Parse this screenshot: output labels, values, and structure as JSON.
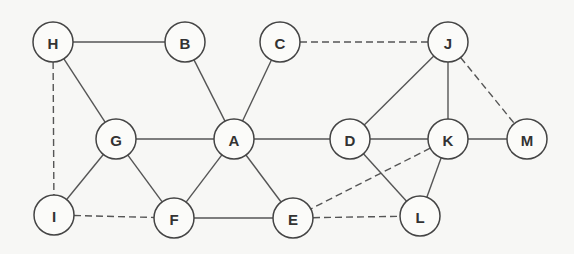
{
  "graph": {
    "node_radius": 20,
    "nodes": [
      {
        "id": "H",
        "label": "H",
        "x": 53,
        "y": 42
      },
      {
        "id": "B",
        "label": "B",
        "x": 185,
        "y": 42
      },
      {
        "id": "C",
        "label": "C",
        "x": 280,
        "y": 42
      },
      {
        "id": "J",
        "label": "J",
        "x": 448,
        "y": 42
      },
      {
        "id": "G",
        "label": "G",
        "x": 116,
        "y": 139
      },
      {
        "id": "A",
        "label": "A",
        "x": 234,
        "y": 139
      },
      {
        "id": "D",
        "label": "D",
        "x": 350,
        "y": 139
      },
      {
        "id": "K",
        "label": "K",
        "x": 448,
        "y": 139
      },
      {
        "id": "M",
        "label": "M",
        "x": 527,
        "y": 139
      },
      {
        "id": "I",
        "label": "I",
        "x": 54,
        "y": 215
      },
      {
        "id": "F",
        "label": "F",
        "x": 174,
        "y": 218
      },
      {
        "id": "E",
        "label": "E",
        "x": 293,
        "y": 218
      },
      {
        "id": "L",
        "label": "L",
        "x": 420,
        "y": 216
      }
    ],
    "edges": [
      {
        "from": "H",
        "to": "B",
        "style": "solid"
      },
      {
        "from": "H",
        "to": "G",
        "style": "solid"
      },
      {
        "from": "H",
        "to": "I",
        "style": "dashed"
      },
      {
        "from": "B",
        "to": "A",
        "style": "solid"
      },
      {
        "from": "C",
        "to": "A",
        "style": "solid"
      },
      {
        "from": "C",
        "to": "J",
        "style": "dashed"
      },
      {
        "from": "J",
        "to": "D",
        "style": "solid"
      },
      {
        "from": "J",
        "to": "K",
        "style": "solid"
      },
      {
        "from": "J",
        "to": "M",
        "style": "dashed"
      },
      {
        "from": "G",
        "to": "A",
        "style": "solid"
      },
      {
        "from": "G",
        "to": "I",
        "style": "solid"
      },
      {
        "from": "G",
        "to": "F",
        "style": "solid"
      },
      {
        "from": "A",
        "to": "F",
        "style": "solid"
      },
      {
        "from": "A",
        "to": "E",
        "style": "solid"
      },
      {
        "from": "A",
        "to": "D",
        "style": "solid"
      },
      {
        "from": "D",
        "to": "K",
        "style": "solid"
      },
      {
        "from": "D",
        "to": "L",
        "style": "solid"
      },
      {
        "from": "K",
        "to": "M",
        "style": "solid"
      },
      {
        "from": "K",
        "to": "L",
        "style": "solid"
      },
      {
        "from": "K",
        "to": "E",
        "style": "dashed"
      },
      {
        "from": "I",
        "to": "F",
        "style": "dashed"
      },
      {
        "from": "F",
        "to": "E",
        "style": "solid"
      },
      {
        "from": "E",
        "to": "L",
        "style": "dashed"
      }
    ]
  }
}
